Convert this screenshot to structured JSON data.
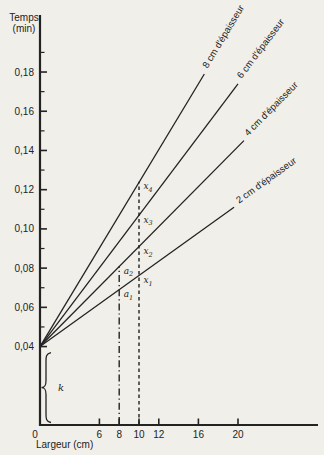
{
  "page": {
    "background": "#f1efe9",
    "ink": "#232323"
  },
  "chart_data": {
    "type": "line",
    "title": "",
    "ylabel_lines": [
      "Temps",
      "(min)"
    ],
    "xlabel": "Largeur (cm)",
    "xlim": [
      0,
      28
    ],
    "ylim": [
      0,
      0.2
    ],
    "grid": false,
    "y_axis": {
      "major_ticks": [
        {
          "value": 0.04,
          "label": "0,04"
        },
        {
          "value": 0.06,
          "label": "0,06"
        },
        {
          "value": 0.08,
          "label": "0,08"
        },
        {
          "value": 0.1,
          "label": "0,10"
        },
        {
          "value": 0.12,
          "label": "0,12"
        },
        {
          "value": 0.14,
          "label": "0,14"
        },
        {
          "value": 0.16,
          "label": "0,16"
        },
        {
          "value": 0.18,
          "label": "0,18"
        }
      ],
      "minor_ticks": [
        0.05,
        0.07,
        0.09,
        0.11,
        0.13,
        0.15,
        0.17,
        0.19
      ]
    },
    "x_axis": {
      "origin_label": "0",
      "ticks": [
        {
          "value": 6,
          "label": "6"
        },
        {
          "value": 8,
          "label": "8"
        },
        {
          "value": 10,
          "label": "10"
        },
        {
          "value": 12,
          "label": "12"
        },
        {
          "value": 16,
          "label": "16"
        },
        {
          "value": 20,
          "label": "20"
        }
      ]
    },
    "intercept_time_min": 0.04,
    "series": [
      {
        "id": "8cm",
        "name": "8 cm d'épaisseur",
        "thickness_cm": 8,
        "x_start": 0,
        "y_start": 0.04,
        "x_end": 16.6,
        "y_end": 0.179,
        "slope_min_per_cm": 0.0084
      },
      {
        "id": "6cm",
        "name": "6 cm d'épaisseur",
        "thickness_cm": 6,
        "x_start": 0,
        "y_start": 0.04,
        "x_end": 20.0,
        "y_end": 0.174,
        "slope_min_per_cm": 0.0067
      },
      {
        "id": "4cm",
        "name": "4 cm d'épaisseur",
        "thickness_cm": 4,
        "x_start": 0,
        "y_start": 0.04,
        "x_end": 20.6,
        "y_end": 0.145,
        "slope_min_per_cm": 0.0051
      },
      {
        "id": "2cm",
        "name": "2 cm d'épaisseur",
        "thickness_cm": 2,
        "x_start": 0,
        "y_start": 0.04,
        "x_end": 19.6,
        "y_end": 0.111,
        "slope_min_per_cm": 0.0036
      }
    ],
    "guides": [
      {
        "id": "x10",
        "x": 10,
        "top_y": 0.124,
        "style": "dashed"
      },
      {
        "id": "x8",
        "x": 8,
        "top_y": 0.081,
        "style": "dashdot"
      }
    ],
    "points": [
      {
        "id": "x4",
        "base": "x",
        "sub": "4",
        "x": 10,
        "y": 0.124
      },
      {
        "id": "x3",
        "base": "x",
        "sub": "3",
        "x": 10,
        "y": 0.107
      },
      {
        "id": "x2",
        "base": "x",
        "sub": "2",
        "x": 10,
        "y": 0.091
      },
      {
        "id": "x1",
        "base": "x",
        "sub": "1",
        "x": 10,
        "y": 0.076
      },
      {
        "id": "a2",
        "base": "a",
        "sub": "2",
        "x": 8,
        "y": 0.081
      },
      {
        "id": "a1",
        "base": "a",
        "sub": "1",
        "x": 8,
        "y": 0.069
      }
    ],
    "k_annotation": {
      "label": "k",
      "from_y": 0,
      "to_y": 0.04
    }
  }
}
